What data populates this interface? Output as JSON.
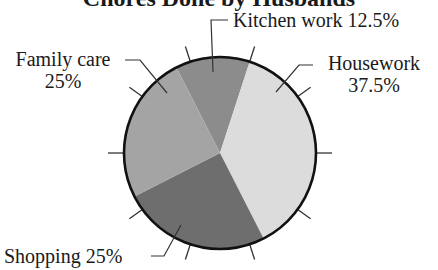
{
  "chart_data": {
    "type": "pie",
    "title": "Chores Done by Husbands",
    "categories": [
      "Kitchen work",
      "Housework",
      "Shopping",
      "Family care"
    ],
    "values": [
      12.5,
      37.5,
      25,
      25
    ],
    "unit": "%",
    "labels": {
      "kitchen": {
        "name": "Kitchen work",
        "value": "12.5%"
      },
      "housework": {
        "name": "Housework",
        "value": "37.5%"
      },
      "shopping": {
        "name": "Shopping",
        "value": "25%"
      },
      "family": {
        "name": "Family care",
        "value": "25%"
      }
    },
    "colors": {
      "kitchen": "#8c8c8c",
      "housework": "#dcdcdc",
      "shopping": "#6e6e6e",
      "family": "#a4a4a4",
      "outline": "#111111"
    },
    "start_angle_deg": -27,
    "direction": "clockwise",
    "tick_marks": {
      "count": 10,
      "spacing_deg": 36,
      "offset_deg": 18
    },
    "legend": "none (callout labels with leader lines)"
  }
}
